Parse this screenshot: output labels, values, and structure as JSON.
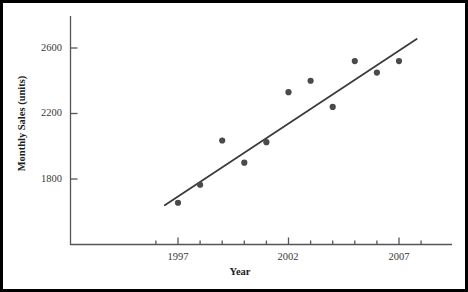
{
  "chart_data": {
    "type": "scatter",
    "title": "",
    "xlabel": "Year",
    "ylabel": "Monthly Sales (units)",
    "xlim": [
      1995.4,
      2008.4
    ],
    "ylim": [
      1480,
      2760
    ],
    "grid": false,
    "legend": null,
    "x": [
      1997,
      1998,
      1999,
      2000,
      2001,
      2002,
      2003,
      2004,
      2005,
      2006,
      2007
    ],
    "values": [
      1655,
      1765,
      2035,
      1900,
      2025,
      2330,
      2400,
      2240,
      2520,
      2450,
      2520
    ],
    "series": [
      {
        "name": "Monthly Sales",
        "marker": "filled-circle",
        "color": "#4a4a4a",
        "values": [
          1655,
          1765,
          2035,
          1900,
          2025,
          2330,
          2400,
          2240,
          2520,
          2450,
          2520
        ]
      }
    ],
    "trendline": {
      "type": "linear",
      "x_start": 1996.4,
      "y_start": 1640,
      "x_end": 2007.8,
      "y_end": 2655,
      "color": "#3a3a3a"
    },
    "y_ticks": [
      1800,
      2200,
      2600
    ],
    "y_tick_labels": [
      "1800",
      "2200",
      "2600"
    ],
    "x_ticks": [
      1996,
      1997,
      1998,
      1999,
      2000,
      2001,
      2002,
      2003,
      2004,
      2005,
      2006,
      2007,
      2008
    ],
    "x_tick_labels": [
      "",
      "1997",
      "",
      "",
      "",
      "",
      "2002",
      "",
      "",
      "",
      "",
      "2007",
      ""
    ],
    "x_major_ticks": [
      1997,
      2002,
      2007
    ]
  },
  "axes": {
    "y_title": "Monthly Sales (units)",
    "x_title": "Year",
    "y_labels": [
      "2600",
      "2200",
      "1800"
    ],
    "x_labels": [
      "1997",
      "2002",
      "2007"
    ]
  },
  "colors": {
    "marker": "#4a4a4a",
    "line": "#3a3a3a",
    "axis": "#555555",
    "border": "#000000",
    "background": "#ffffff",
    "tick_text": "#3a3a3a",
    "title_text": "#1d1d1d"
  }
}
